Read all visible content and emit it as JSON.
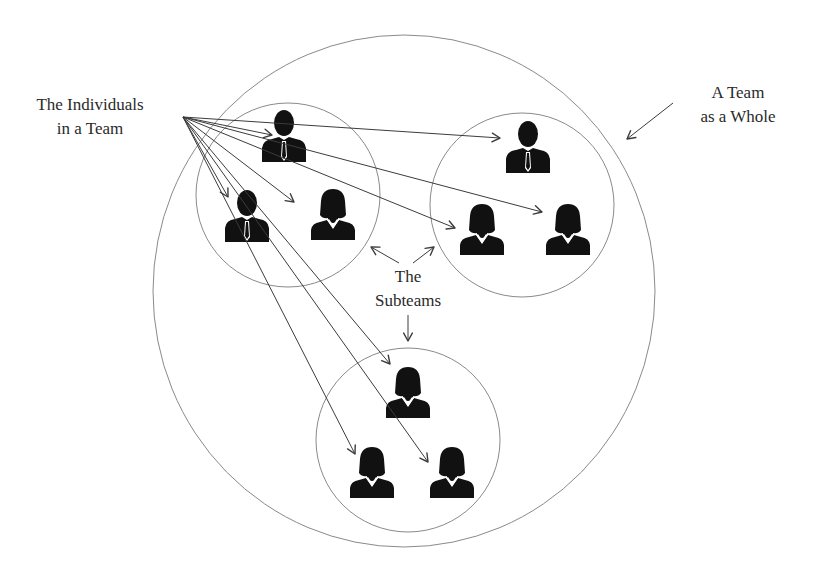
{
  "labels": {
    "individuals": {
      "line1": "The Individuals",
      "line2": "in a Team",
      "x": 90,
      "y": 93
    },
    "team_whole": {
      "line1": "A Team",
      "line2": "as a Whole",
      "x": 738,
      "y": 81
    },
    "subteams": {
      "line1": "The",
      "line2": "Subteams",
      "x": 408,
      "y": 265
    }
  },
  "colors": {
    "stroke": "#8a8a8a",
    "arrow": "#3c3c3c",
    "figure": "#111111",
    "text": "#2a2a2a"
  },
  "team_circle": {
    "cx": 404,
    "cy": 291,
    "rx": 251,
    "ry": 256
  },
  "subteams": [
    {
      "name": "left-subteam",
      "cx": 288,
      "cy": 195,
      "r": 92,
      "members": [
        {
          "type": "male",
          "x": 284,
          "y": 110
        },
        {
          "type": "male",
          "x": 247,
          "y": 190
        },
        {
          "type": "female",
          "x": 333,
          "y": 188
        }
      ]
    },
    {
      "name": "right-subteam",
      "cx": 522,
      "cy": 205,
      "r": 92,
      "members": [
        {
          "type": "male",
          "x": 528,
          "y": 121
        },
        {
          "type": "female",
          "x": 482,
          "y": 203
        },
        {
          "type": "female",
          "x": 568,
          "y": 203
        }
      ]
    },
    {
      "name": "bottom-subteam",
      "cx": 408,
      "cy": 440,
      "r": 92,
      "members": [
        {
          "type": "female",
          "x": 408,
          "y": 366
        },
        {
          "type": "female",
          "x": 372,
          "y": 446
        },
        {
          "type": "female",
          "x": 452,
          "y": 446
        }
      ]
    }
  ],
  "individual_arrows": {
    "origin": [
      183,
      117
    ],
    "targets": [
      [
        272,
        135
      ],
      [
        500,
        138
      ],
      [
        294,
        202
      ],
      [
        228,
        197
      ],
      [
        542,
        212
      ],
      [
        455,
        228
      ],
      [
        390,
        364
      ],
      [
        355,
        454
      ],
      [
        428,
        462
      ]
    ]
  },
  "subteam_arrows": [
    {
      "from": [
        399,
        263
      ],
      "to": [
        371,
        247
      ]
    },
    {
      "from": [
        413,
        263
      ],
      "to": [
        434,
        247
      ]
    },
    {
      "from": [
        408,
        315
      ],
      "to": [
        408,
        341
      ]
    }
  ],
  "whole_arrow": {
    "from": [
      673,
      103
    ],
    "to": [
      627,
      139
    ]
  }
}
